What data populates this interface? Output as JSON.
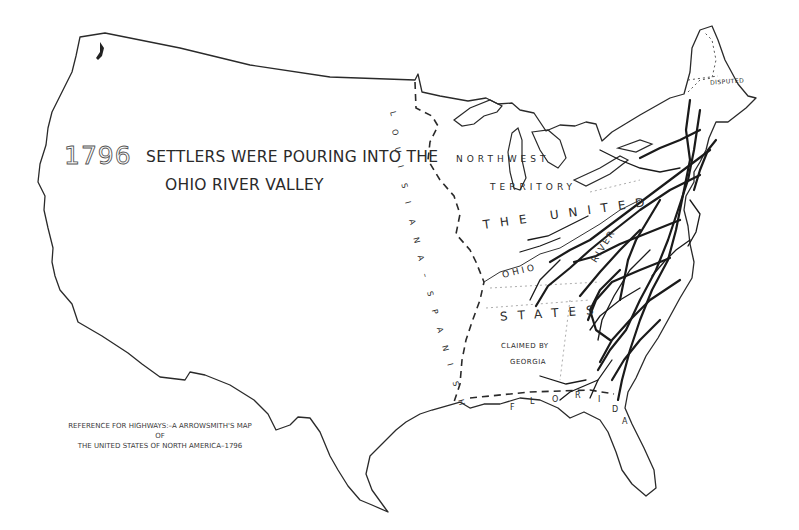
{
  "map": {
    "year": "1796",
    "title_line1": "SETTLERS WERE POURING INTO THE",
    "title_line2": "OHIO RIVER VALLEY",
    "labels": {
      "northwest": "NORTHWEST",
      "territory": "TERRITORY",
      "the_united": "THE UNITED",
      "states": "STATES",
      "ohio": "OHIO",
      "river": "RIVER",
      "claimed_by": "CLAIMED BY",
      "georgia": "GEORGIA",
      "disputed": "DISPUTED",
      "louisiana_spanish": [
        "L",
        "O",
        "U",
        "I",
        "S",
        "I",
        "A",
        "N",
        "A",
        "–",
        "S",
        "P",
        "A",
        "N",
        "I",
        "S",
        "H"
      ],
      "florida": [
        "F",
        "L",
        "O",
        "R",
        "I",
        "D",
        "A"
      ]
    },
    "reference": {
      "line1": "REFERENCE FOR HIGHWAYS:–A ARROWSMITH'S MAP",
      "line2": "OF",
      "line3": "THE UNITED STATES OF NORTH AMERICA–1796"
    }
  }
}
